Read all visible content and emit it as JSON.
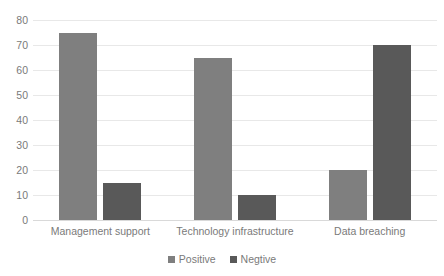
{
  "chart_data": {
    "type": "bar",
    "title": "",
    "subtitle": "",
    "xlabel": "",
    "ylabel": "",
    "categories": [
      "Management support",
      "Technology infrastructure",
      "Data breaching"
    ],
    "series": [
      {
        "name": "Positive",
        "values": [
          75,
          65,
          20
        ],
        "color": "#7f7f7f"
      },
      {
        "name": "Negtive",
        "values": [
          15,
          10,
          70
        ],
        "color": "#595959"
      }
    ],
    "ylim": [
      0,
      80
    ],
    "ytick_step": 10,
    "yticks": [
      80,
      70,
      60,
      50,
      40,
      30,
      20,
      10,
      0
    ],
    "ytick_labels": [
      "80",
      "70",
      "60",
      "50",
      "40",
      "30",
      "20",
      "10",
      "0"
    ],
    "grid": true,
    "grid_axis": "y",
    "legend": true,
    "legend_position": "bottom",
    "legend_entries": [
      "Positive",
      "Negtive"
    ],
    "grouping": "grouped",
    "background_color": "#ffffff",
    "gridline_color": "#e8e8e8",
    "text_color": "#7a7a7a"
  }
}
